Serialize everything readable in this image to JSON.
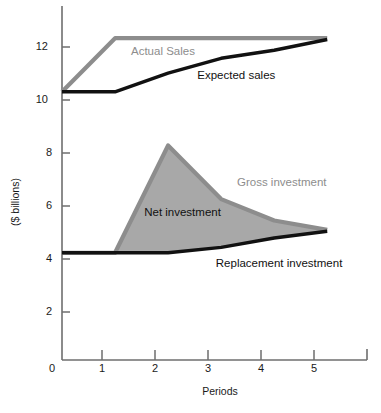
{
  "chart_data": {
    "type": "line",
    "title": "",
    "subtitle": "",
    "xlabel": "Periods",
    "ylabel": "($ billions)",
    "xlim": [
      0,
      5.75
    ],
    "ylim": [
      0,
      13.2
    ],
    "grid": false,
    "legend_position": "inline-annotations",
    "x_tick_labels": [
      "0",
      "1",
      "2",
      "3",
      "4",
      "5"
    ],
    "x_tick_values": [
      0,
      1,
      2,
      3,
      4,
      5
    ],
    "y_tick_labels": [
      "2",
      "4",
      "6",
      "8",
      "10",
      "12"
    ],
    "y_tick_values": [
      2,
      4,
      6,
      8,
      10,
      12
    ],
    "x": [
      0,
      1,
      2,
      3,
      4,
      5
    ],
    "series": [
      {
        "name": "Actual Sales",
        "color": "#8d8d8d",
        "values": [
          10,
          12,
          12,
          12,
          12,
          12
        ]
      },
      {
        "name": "Expected sales",
        "color": "#111111",
        "values": [
          10,
          10,
          10.7,
          11.25,
          11.55,
          11.95
        ]
      },
      {
        "name": "Gross investment",
        "color": "#8d8d8d",
        "values": [
          4,
          4,
          8,
          6,
          5.2,
          4.85
        ]
      },
      {
        "name": "Replacement investment",
        "color": "#111111",
        "values": [
          4,
          4,
          4,
          4.2,
          4.55,
          4.8
        ]
      }
    ],
    "filled_areas": [
      {
        "name": "Net investment",
        "between": [
          "Gross investment",
          "Replacement investment"
        ],
        "fill_color": "#a8a8a8"
      }
    ],
    "annotations": [
      {
        "text": "Actual Sales",
        "x": 1.3,
        "y": 11.45,
        "color": "#8d8d8d"
      },
      {
        "text": "Expected sales",
        "x": 2.55,
        "y": 10.55,
        "color": "#111111"
      },
      {
        "text": "Gross investment",
        "x": 3.3,
        "y": 6.55,
        "color": "#8d8d8d"
      },
      {
        "text": "Net investment",
        "x": 1.55,
        "y": 5.45,
        "color": "#111111"
      },
      {
        "text": "Replacement investment",
        "x": 2.9,
        "y": 3.55,
        "color": "#111111"
      }
    ],
    "colors": {
      "axis": "#6e6e6e",
      "gray_series": "#8d8d8d",
      "black_series": "#111111",
      "area_fill": "#a8a8a8",
      "background": "#ffffff"
    }
  }
}
